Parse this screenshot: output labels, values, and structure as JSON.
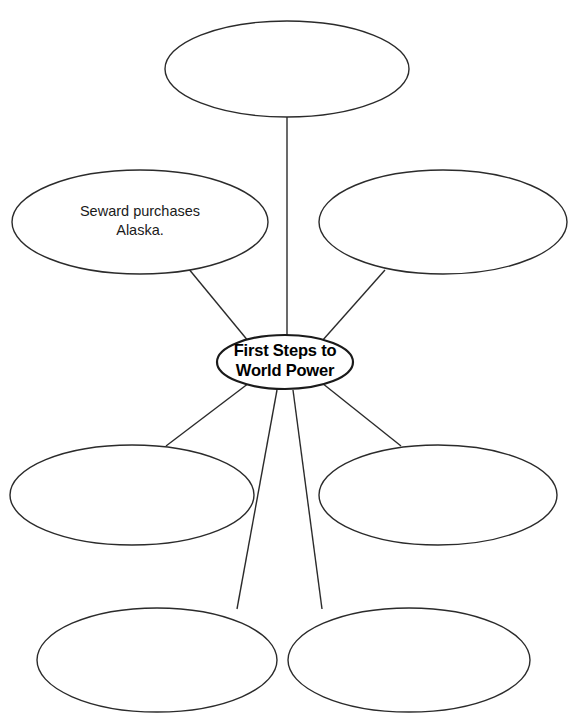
{
  "diagram": {
    "type": "web-organizer",
    "title_visible": false,
    "center": {
      "id": "hub",
      "lines": [
        "First Steps to",
        "World Power"
      ],
      "cx": 285,
      "cy": 362,
      "rx": 68,
      "ry": 27,
      "bold": true
    },
    "nodes": [
      {
        "id": "node-top",
        "lines": [],
        "cx": 287,
        "cy": 69,
        "rx": 122,
        "ry": 48
      },
      {
        "id": "node-upper-left",
        "lines": [
          "Seward purchases",
          "Alaska."
        ],
        "cx": 140,
        "cy": 222,
        "rx": 128,
        "ry": 52
      },
      {
        "id": "node-upper-right",
        "lines": [],
        "cx": 443,
        "cy": 222,
        "rx": 124,
        "ry": 52
      },
      {
        "id": "node-mid-left",
        "lines": [],
        "cx": 132,
        "cy": 495,
        "rx": 122,
        "ry": 50
      },
      {
        "id": "node-mid-right",
        "lines": [],
        "cx": 438,
        "cy": 495,
        "rx": 119,
        "ry": 50
      },
      {
        "id": "node-bottom-left",
        "lines": [],
        "cx": 157,
        "cy": 660,
        "rx": 120,
        "ry": 52
      },
      {
        "id": "node-bottom-right",
        "lines": [],
        "cx": 409,
        "cy": 660,
        "rx": 121,
        "ry": 52
      }
    ],
    "connectors": [
      {
        "id": "connector-top",
        "x1": 287,
        "y1": 117,
        "x2": 287,
        "y2": 337
      },
      {
        "id": "connector-upper-left",
        "x1": 188,
        "y1": 268,
        "x2": 249,
        "y2": 342
      },
      {
        "id": "connector-upper-right",
        "x1": 385,
        "y1": 270,
        "x2": 322,
        "y2": 341
      },
      {
        "id": "connector-mid-left",
        "x1": 166,
        "y1": 446,
        "x2": 249,
        "y2": 383
      },
      {
        "id": "connector-mid-right",
        "x1": 401,
        "y1": 446,
        "x2": 322,
        "y2": 383
      },
      {
        "id": "connector-bottom-left",
        "x1": 237,
        "y1": 609,
        "x2": 277,
        "y2": 390
      },
      {
        "id": "connector-bottom-right",
        "x1": 322,
        "y1": 609,
        "x2": 293,
        "y2": 390
      }
    ],
    "colors": {
      "background": "#ffffff",
      "stroke": "#2b2b2b",
      "hub_stroke": "#1a1a1a",
      "text": "#1a1a1a"
    }
  }
}
